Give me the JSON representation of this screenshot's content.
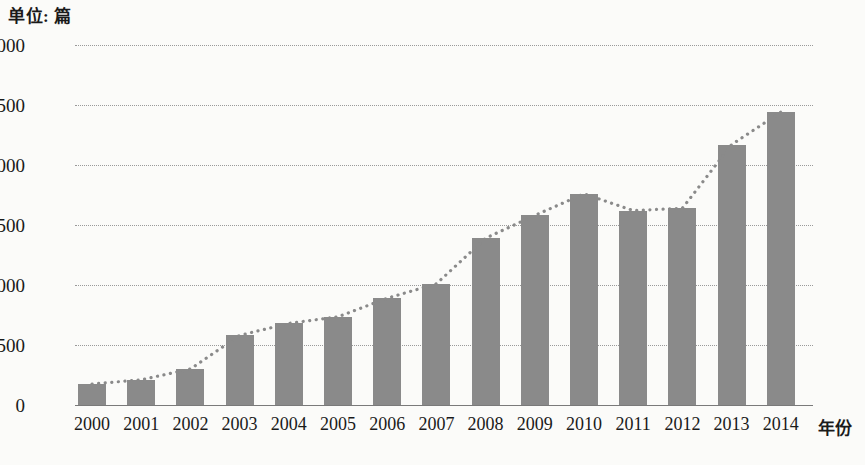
{
  "unit_label": "单位: 篇",
  "axis": {
    "x_title": "年份",
    "y_ticks": [
      "3000",
      "2500",
      "2000",
      "1500",
      "1000",
      "500",
      "0"
    ]
  },
  "colors": {
    "bar": "#8a8a8a",
    "gridline": "#9a9a9a",
    "baseline": "#7a7a7a",
    "trendline": "#8a8a8a",
    "text": "#1a1a1a",
    "background": "#fbfbf9"
  },
  "chart_data": {
    "type": "bar",
    "title": "",
    "subtitle": "",
    "xlabel": "年份",
    "ylabel": "单位: 篇",
    "ylim": [
      0,
      3000
    ],
    "ytick_values": [
      0,
      500,
      1000,
      1500,
      2000,
      2500,
      3000
    ],
    "grid": true,
    "legend": "none",
    "annotations": [
      "单位: 篇"
    ],
    "categories": [
      "2000",
      "2001",
      "2002",
      "2003",
      "2004",
      "2005",
      "2006",
      "2007",
      "2008",
      "2009",
      "2010",
      "2011",
      "2012",
      "2013",
      "2014"
    ],
    "values": [
      175,
      210,
      300,
      580,
      680,
      735,
      890,
      1010,
      1390,
      1580,
      1760,
      1620,
      1640,
      2170,
      2440
    ],
    "series": [
      {
        "name": "论文数量",
        "type": "bar",
        "values": [
          175,
          210,
          300,
          580,
          680,
          735,
          890,
          1010,
          1390,
          1580,
          1760,
          1620,
          1640,
          2170,
          2440
        ]
      },
      {
        "name": "趋势线",
        "type": "line",
        "style": "dotted",
        "values": [
          175,
          210,
          300,
          580,
          680,
          735,
          890,
          1010,
          1390,
          1580,
          1760,
          1620,
          1640,
          2170,
          2440
        ]
      }
    ]
  }
}
